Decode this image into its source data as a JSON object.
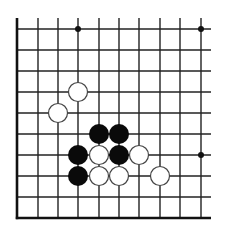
{
  "board": {
    "type": "go-diagram",
    "columns": 10,
    "rows": 10,
    "col_x": [
      17,
      38,
      58,
      78,
      99,
      119,
      139,
      160,
      180,
      201
    ],
    "row_y": [
      29,
      50,
      71,
      92,
      113,
      134,
      155,
      176,
      197,
      218
    ],
    "line_color": "#222222",
    "edge_color": "#111111",
    "background": "#ffffff",
    "edges": {
      "left": true,
      "bottom": true,
      "top": false,
      "right": false
    },
    "vertical_line_top": 18,
    "horizontal_line_right": 211,
    "star_points": [
      {
        "col": 3,
        "row": 0
      },
      {
        "col": 9,
        "row": 0
      },
      {
        "col": 9,
        "row": 6
      }
    ],
    "stone_radius": 9.5,
    "stones": [
      {
        "color": "white",
        "col": 3,
        "row": 3
      },
      {
        "color": "white",
        "col": 2,
        "row": 4
      },
      {
        "color": "black",
        "col": 4,
        "row": 5
      },
      {
        "color": "black",
        "col": 5,
        "row": 5
      },
      {
        "color": "black",
        "col": 3,
        "row": 6
      },
      {
        "color": "white",
        "col": 4,
        "row": 6
      },
      {
        "color": "black",
        "col": 5,
        "row": 6
      },
      {
        "color": "white",
        "col": 6,
        "row": 6
      },
      {
        "color": "black",
        "col": 3,
        "row": 7
      },
      {
        "color": "white",
        "col": 4,
        "row": 7
      },
      {
        "color": "white",
        "col": 5,
        "row": 7
      },
      {
        "color": "white",
        "col": 7,
        "row": 7
      }
    ],
    "colors": {
      "black_stone": "#0a0a0a",
      "white_stone_fill": "#ffffff",
      "white_stone_stroke": "#444444"
    }
  }
}
